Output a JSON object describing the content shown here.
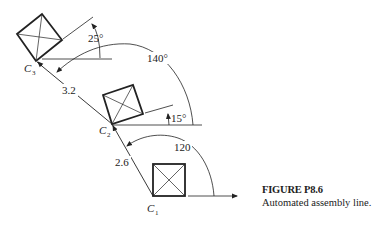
{
  "figure": {
    "title": "FIGURE P8.6",
    "description": "Automated assembly line."
  },
  "points": {
    "c1": {
      "label": "C",
      "subscript": "1"
    },
    "c2": {
      "label": "C",
      "subscript": "2"
    },
    "c3": {
      "label": "C",
      "subscript": "3"
    }
  },
  "dimensions": {
    "link_c1_c2": "2.6",
    "link_c2_c3": "3.2",
    "angle_c1": "120",
    "angle_c2_link": "140°",
    "angle_c2_square": "15°",
    "angle_c3_square": "25°"
  },
  "colors": {
    "line": "#222222",
    "background": "#ffffff"
  }
}
